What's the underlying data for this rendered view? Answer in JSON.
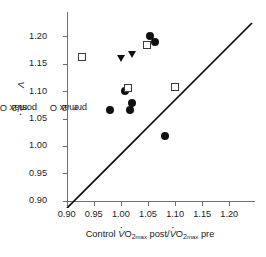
{
  "chart_data": {
    "type": "scatter",
    "title": "",
    "xlabel": "Control VO2 max post/VO2 max pre",
    "ylabel": "Experimental VO2 max post/VO2 max pre",
    "xlim": [
      0.9,
      1.215
    ],
    "ylim": [
      0.885,
      1.215
    ],
    "xticks": [
      0.9,
      0.95,
      1.0,
      1.05,
      1.1,
      1.15,
      1.2
    ],
    "xtick_labels": [
      "0.90",
      "0.95",
      "1.00",
      "1.05",
      "1.10",
      "1.15",
      "1.20"
    ],
    "yticks": [
      0.9,
      0.95,
      1.0,
      1.05,
      1.1,
      1.15,
      1.2
    ],
    "ytick_labels": [
      "0.90",
      "0.95",
      "1.00",
      "1.05",
      "1.10",
      "1.15",
      "1.20"
    ],
    "grid": false,
    "legend": "none",
    "marker_color": "#111111",
    "open_marker_edge_color": "#3a3a3a",
    "line_color": "#000000",
    "reference_line": {
      "name": "identity-line",
      "type": "line",
      "x": [
        0.885,
        1.215
      ],
      "y": [
        0.885,
        1.215
      ],
      "label": ""
    },
    "series": [
      {
        "name": "filled-circle",
        "marker": "circle-filled",
        "points": [
          {
            "x": 1.054,
            "y": 1.2
          },
          {
            "x": 1.063,
            "y": 1.19
          },
          {
            "x": 1.008,
            "y": 1.1
          },
          {
            "x": 1.02,
            "y": 1.078
          },
          {
            "x": 1.017,
            "y": 1.065
          },
          {
            "x": 0.98,
            "y": 1.066
          },
          {
            "x": 1.082,
            "y": 1.018
          }
        ]
      },
      {
        "name": "open-square",
        "marker": "square-open",
        "points": [
          {
            "x": 0.928,
            "y": 1.163
          },
          {
            "x": 1.048,
            "y": 1.185
          },
          {
            "x": 1.013,
            "y": 1.106
          },
          {
            "x": 1.099,
            "y": 1.108
          }
        ]
      },
      {
        "name": "filled-triangle-down",
        "marker": "triangle-down-filled",
        "points": [
          {
            "x": 1.002,
            "y": 1.16
          },
          {
            "x": 1.021,
            "y": 1.167
          }
        ]
      }
    ]
  },
  "axes": {
    "x_title_prefix": "Control ",
    "y_title_prefix": "Experimental ",
    "v_symbol": "V",
    "o_symbol": "O",
    "two": "2",
    "max": "max",
    "post": " post/",
    "pre": " pre"
  }
}
